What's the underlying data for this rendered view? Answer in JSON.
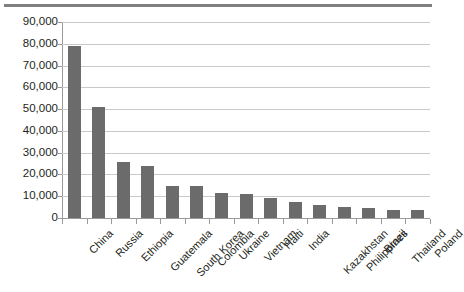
{
  "chart_data": {
    "type": "bar",
    "title": "",
    "subtitle": "",
    "xlabel": "",
    "ylabel": "",
    "ylim": [
      0,
      90000
    ],
    "ytick_step": 10000,
    "grid": true,
    "legend": false,
    "legend_position": "none",
    "bar_color": "#6b6b6b",
    "gridline_color": "#c9c9c9",
    "axis_color": "#9a9a9a",
    "text_color": "#231f20",
    "ytick_labels": [
      "90,000",
      "80,000",
      "70,000",
      "60,000",
      "50,000",
      "40,000",
      "30,000",
      "20,000",
      "10,000",
      "0"
    ],
    "ytick_values": [
      90000,
      80000,
      70000,
      60000,
      50000,
      40000,
      30000,
      20000,
      10000,
      0
    ],
    "categories": [
      "China",
      "Russia",
      "Ethiopia",
      "Guatemala",
      "South Korea",
      "Colombia",
      "Ukraine",
      "Vietnam",
      "Haiti",
      "India",
      "Kazakhstan",
      "Philippines",
      "Brazil",
      "Thailand",
      "Poland"
    ],
    "values": [
      79000,
      51000,
      25500,
      24000,
      14800,
      14700,
      11500,
      11200,
      9000,
      7500,
      6000,
      5000,
      4600,
      3800,
      3600
    ]
  }
}
